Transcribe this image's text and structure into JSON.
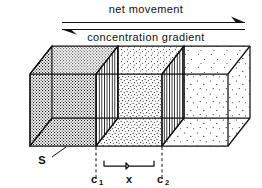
{
  "figure": {
    "kind": "diffusion-diagram",
    "annotations": {
      "net_movement_label": "net movement",
      "concentration_gradient_label": "concentration gradient",
      "area_label": "S",
      "plane_left_label": "c",
      "plane_left_sub": "1",
      "distance_label": "x",
      "plane_right_label": "c",
      "plane_right_sub": "2"
    },
    "arrows": {
      "net_movement_direction": "right",
      "concentration_gradient_direction": "left"
    },
    "colors": {
      "ink": "#101010",
      "stipple": "#1a1a1a",
      "background": "#ffffff"
    },
    "regions": [
      {
        "name": "high-concentration",
        "density": 1.0
      },
      {
        "name": "medium-concentration",
        "density": 0.42
      },
      {
        "name": "low-concentration",
        "density": 0.12
      }
    ]
  }
}
